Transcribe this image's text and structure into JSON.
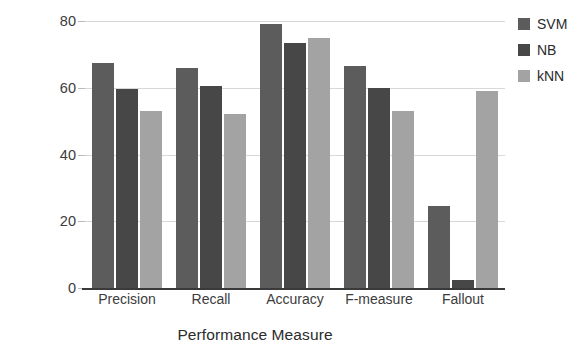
{
  "chart_data": {
    "type": "bar",
    "title": "",
    "subtitle": "",
    "xlabel": "Performance Measure",
    "ylabel": "Percentage",
    "categories": [
      "Precision",
      "Recall",
      "Accuracy",
      "F-measure",
      "Fallout"
    ],
    "series": [
      {
        "name": "SVM",
        "color": "#5c5c5c",
        "values": [
          67.5,
          66.0,
          79.0,
          66.5,
          24.5
        ]
      },
      {
        "name": "NB",
        "color": "#474747",
        "values": [
          59.5,
          60.5,
          73.5,
          60.0,
          2.5
        ]
      },
      {
        "name": "kNN",
        "color": "#a3a3a3",
        "values": [
          53.0,
          52.0,
          75.0,
          53.0,
          59.0
        ]
      }
    ],
    "ylim": [
      0,
      80
    ],
    "yticks": [
      0,
      20,
      40,
      60,
      80
    ],
    "ytick_labels": [
      "0",
      "20",
      "40",
      "60",
      "80"
    ],
    "grid": "horizontal",
    "legend_position": "right",
    "legend_entries": [
      "SVM",
      "NB",
      "kNN"
    ]
  },
  "colors": {
    "background": "#ffffff",
    "gridline": "#d8d8d8",
    "axis": "#3a3a3a",
    "text": "#2b2b2b",
    "tick_text": "#3c3c3c"
  }
}
